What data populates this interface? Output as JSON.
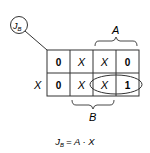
{
  "diagram": {
    "type": "karnaugh-map",
    "label": {
      "main": "J",
      "sub": "B"
    },
    "column_var": "A",
    "column_var_bottom": "B",
    "row_var": "X",
    "cells": [
      [
        "0",
        "X",
        "X",
        "0"
      ],
      [
        "0",
        "X",
        "X",
        "1"
      ]
    ],
    "grouping": "loop around X and 1 in row X, columns 3-4",
    "equation": {
      "lhs_main": "J",
      "lhs_sub": "B",
      "rhs": "= A · X"
    }
  }
}
